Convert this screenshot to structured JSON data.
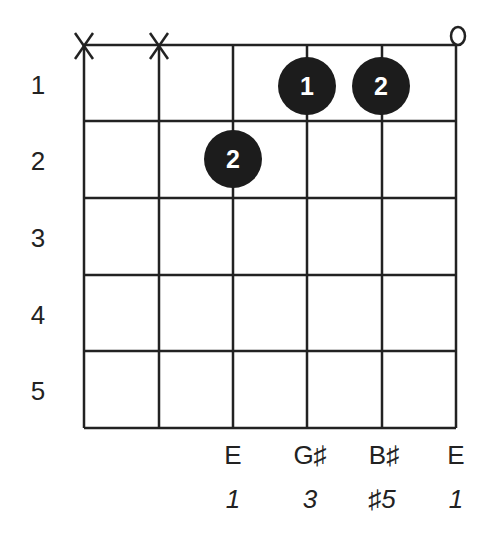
{
  "chord": {
    "strings": 6,
    "frets_shown": 5,
    "fret_numbers": [
      "1",
      "2",
      "3",
      "4",
      "5"
    ],
    "string_markers": [
      "X",
      "X",
      "",
      "",
      "",
      "O"
    ],
    "fingers": [
      {
        "string": 3,
        "fret": 2,
        "finger": "2"
      },
      {
        "string": 4,
        "fret": 1,
        "finger": "1"
      },
      {
        "string": 5,
        "fret": 1,
        "finger": "2"
      }
    ],
    "notes": [
      {
        "string": 3,
        "note": "E",
        "degree": "1"
      },
      {
        "string": 4,
        "note": "G♯",
        "degree": "3"
      },
      {
        "string": 5,
        "note": "B♯",
        "degree": "♯5"
      },
      {
        "string": 6,
        "note": "E",
        "degree": "1"
      }
    ]
  }
}
